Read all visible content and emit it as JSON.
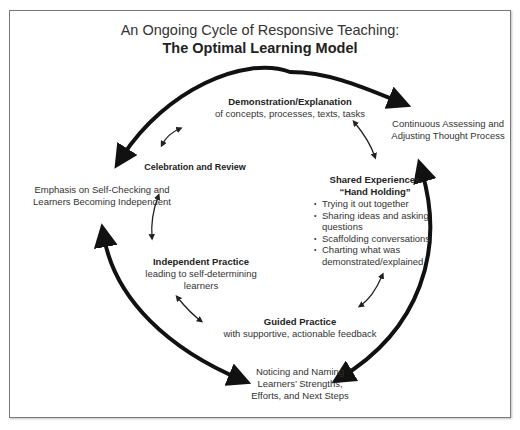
{
  "title": {
    "line1": "An Ongoing Cycle of Responsive Teaching:",
    "line2": "The Optimal Learning Model"
  },
  "stages": {
    "demonstration": {
      "heading": "Demonstration/Explanation",
      "sub": "of concepts, processes, texts, tasks"
    },
    "shared": {
      "heading1": "Shared Experiences",
      "heading2": "“Hand Holding”",
      "bullets": [
        "Trying it out together",
        "Sharing ideas and asking questions",
        "Scaffolding conversations",
        "Charting what was demonstrated/explained"
      ]
    },
    "guided": {
      "heading": "Guided Practice",
      "sub": "with supportive, actionable feedback"
    },
    "independent": {
      "heading": "Independent Practice",
      "sub1": "leading to self-determining",
      "sub2": "learners"
    },
    "celebration": {
      "heading": "Celebration and Review"
    }
  },
  "outer_labels": {
    "continuous": {
      "line1": "Continuous Assessing and",
      "line2": "Adjusting Thought Process"
    },
    "emphasis": {
      "line1": "Emphasis on Self-Checking and",
      "line2": "Learners Becoming Independent"
    },
    "noticing": {
      "line1": "Noticing and Naming",
      "line2": "Learners’ Strengths,",
      "line3": "Efforts, and Next Steps"
    }
  },
  "colors": {
    "arrow": "#111111",
    "frame": "#7a7a7a",
    "text": "#333333"
  }
}
